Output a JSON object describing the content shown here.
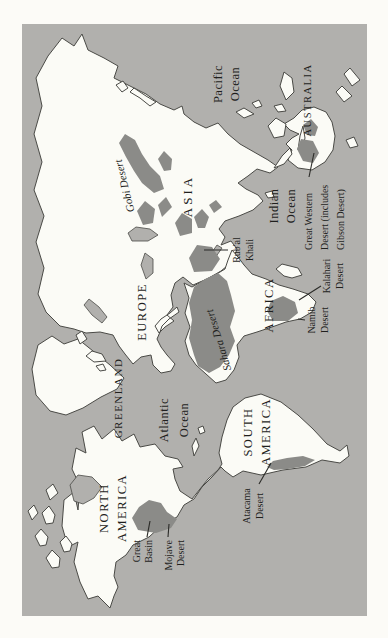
{
  "page": {
    "background": "#fcfbf7",
    "kind": "book map figure"
  },
  "map": {
    "type": "world-deserts-map",
    "orientation": "rotated-90-ccw-to-fit-portrait-page",
    "colors": {
      "ocean": "#b1b0ad",
      "land": "#fbfbf6",
      "desert": "#8b8b88",
      "coastline": "#4a4a46",
      "label": "#1f1f1d",
      "leader": "#2b2b28"
    },
    "continents": [
      {
        "name": "North America",
        "lines": [
          "NORTH",
          "AMERICA"
        ]
      },
      {
        "name": "South America",
        "lines": [
          "SOUTH",
          "AMERICA"
        ]
      },
      {
        "name": "Greenland",
        "lines": [
          "GREENLAND"
        ]
      },
      {
        "name": "Europe",
        "lines": [
          "EUROPE"
        ]
      },
      {
        "name": "Africa",
        "lines": [
          "AFRICA"
        ]
      },
      {
        "name": "Asia",
        "lines": [
          "ASIA"
        ]
      },
      {
        "name": "Australia",
        "lines": [
          "AUSTRALIA"
        ]
      }
    ],
    "oceans": [
      {
        "name": "Pacific Ocean",
        "lines": [
          "Pacific",
          "Ocean"
        ]
      },
      {
        "name": "Atlantic Ocean",
        "lines": [
          "Atlantic",
          "Ocean"
        ]
      },
      {
        "name": "Indian Ocean",
        "lines": [
          "Indian",
          "Ocean"
        ]
      }
    ],
    "deserts": [
      {
        "name": "Great Basin",
        "lines": [
          "Great",
          "Basin"
        ]
      },
      {
        "name": "Mojave Desert",
        "lines": [
          "Mojave",
          "Desert"
        ]
      },
      {
        "name": "Atacama Desert",
        "lines": [
          "Atacama",
          "Desert"
        ]
      },
      {
        "name": "Sahara Desert",
        "lines": [
          "Sahara Desert"
        ]
      },
      {
        "name": "Namib Desert",
        "lines": [
          "Namib",
          "Desert"
        ]
      },
      {
        "name": "Kalahari Desert",
        "lines": [
          "Kalahari",
          "Desert"
        ]
      },
      {
        "name": "Rub'al Khali",
        "lines": [
          "Rub'al",
          "Khali"
        ]
      },
      {
        "name": "Gobi Desert",
        "lines": [
          "Gobi Desert"
        ]
      },
      {
        "name": "Great Western Desert (includes Gibson Desert)",
        "lines": [
          "Great Western",
          "Desert (includes",
          "Gibson Desert)"
        ]
      }
    ]
  }
}
